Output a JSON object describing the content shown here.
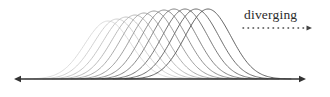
{
  "figure": {
    "title": "",
    "background_color": "#ffffff",
    "width": 330,
    "height": 97
  },
  "annotation": {
    "label": "diverging",
    "label_x": 244,
    "label_y": 6,
    "arrow": {
      "name": "dotted-arrow",
      "style": "dotted",
      "direction": "right",
      "x_start": 243,
      "x_end": 312,
      "y": 28,
      "color": "#444444"
    }
  },
  "axis": {
    "name": "horizontal-axis",
    "y": 79,
    "x_start": 14,
    "x_end": 306,
    "color": "#333333",
    "arrowheads": "both"
  },
  "chart_data": {
    "type": "line",
    "title": "",
    "subtitle": "",
    "xlabel": "",
    "ylabel": "",
    "grid": false,
    "legend": "none",
    "annotations": [
      "diverging"
    ],
    "xlim": [
      0,
      330
    ],
    "ylim": [
      0,
      97
    ],
    "baseline_y": 79,
    "peak_y": 9,
    "series": [
      {
        "name": "curve-1",
        "peak_x": 108,
        "width": 46,
        "peak_height": 58,
        "color": "#d8d8d8"
      },
      {
        "name": "curve-2",
        "peak_x": 117,
        "width": 46,
        "peak_height": 60,
        "color": "#cccccc"
      },
      {
        "name": "curve-3",
        "peak_x": 126,
        "width": 46,
        "peak_height": 62,
        "color": "#bfbfbf"
      },
      {
        "name": "curve-4",
        "peak_x": 135,
        "width": 46,
        "peak_height": 64,
        "color": "#b2b2b2"
      },
      {
        "name": "curve-5",
        "peak_x": 144,
        "width": 46,
        "peak_height": 66,
        "color": "#a3a3a3"
      },
      {
        "name": "curve-6",
        "peak_x": 154,
        "width": 46,
        "peak_height": 68,
        "color": "#949494"
      },
      {
        "name": "curve-7",
        "peak_x": 164,
        "width": 46,
        "peak_height": 69,
        "color": "#858585"
      },
      {
        "name": "curve-8",
        "peak_x": 174,
        "width": 46,
        "peak_height": 70,
        "color": "#777777"
      },
      {
        "name": "curve-9",
        "peak_x": 185,
        "width": 46,
        "peak_height": 70,
        "color": "#6a6a6a"
      },
      {
        "name": "curve-10",
        "peak_x": 196,
        "width": 46,
        "peak_height": 70,
        "color": "#5e5e5e"
      },
      {
        "name": "curve-11",
        "peak_x": 208,
        "width": 46,
        "peak_height": 70,
        "color": "#535353"
      }
    ]
  }
}
